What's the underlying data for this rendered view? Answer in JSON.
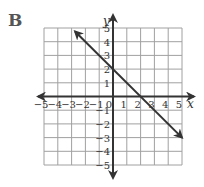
{
  "panel": {
    "label": "B"
  },
  "chart_data": {
    "type": "line",
    "title": "",
    "panel_label": "B",
    "xlabel": "x",
    "ylabel": "y",
    "xlim": [
      -5,
      5
    ],
    "ylim": [
      -5,
      5
    ],
    "grid": true,
    "x_ticks": [
      "−5",
      "−4",
      "−3",
      "−2",
      "−1",
      "0",
      "1",
      "2",
      "3",
      "4",
      "5"
    ],
    "y_ticks": [
      "5",
      "4",
      "3",
      "2",
      "1",
      "−1",
      "−2",
      "−3",
      "−4",
      "−5"
    ],
    "series": [
      {
        "name": "y = −x + 2",
        "equation": "y = -x + 2",
        "slope": -1,
        "y_intercept": 2,
        "x_intercept": 2,
        "x": [
          -2.75,
          0,
          2,
          5
        ],
        "y": [
          4.75,
          2,
          0,
          -3
        ],
        "arrows": "both"
      }
    ]
  },
  "colors": {
    "grid": "#a0a0a0",
    "axis": "#333333",
    "line": "#333333",
    "label": "#555555"
  }
}
